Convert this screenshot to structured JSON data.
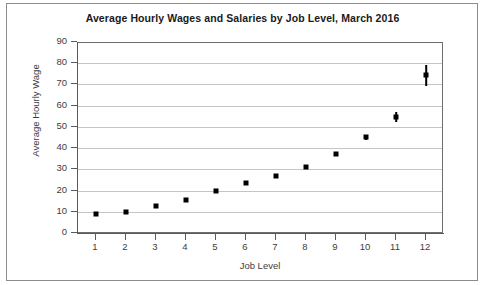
{
  "chart_data": {
    "type": "scatter",
    "title": "Average Hourly Wages and Salaries by Job Level, March 2016",
    "xlabel": "Job Level",
    "ylabel": "Average Hourly Wage",
    "xlim": [
      0.4,
      12.6
    ],
    "ylim": [
      0,
      90
    ],
    "grid": true,
    "legend": null,
    "x_ticks": [
      "1",
      "2",
      "3",
      "4",
      "5",
      "6",
      "7",
      "8",
      "9",
      "10",
      "11",
      "12"
    ],
    "y_ticks": [
      "0",
      "10",
      "20",
      "30",
      "40",
      "50",
      "60",
      "70",
      "80",
      "90"
    ],
    "x": [
      1,
      2,
      3,
      4,
      5,
      6,
      7,
      8,
      9,
      10,
      11,
      12
    ],
    "values": [
      9.2,
      10.2,
      13.0,
      16.1,
      20.2,
      24.2,
      27.5,
      31.4,
      37.5,
      45.6,
      55.0,
      74.8
    ],
    "error_low": [
      9.2,
      10.2,
      13.0,
      16.1,
      20.2,
      24.2,
      27.5,
      31.4,
      37.5,
      44.4,
      52.6,
      69.8
    ],
    "error_high": [
      9.2,
      10.2,
      13.0,
      16.1,
      20.2,
      24.2,
      27.5,
      31.4,
      37.5,
      46.8,
      57.4,
      79.8
    ],
    "marker": "square",
    "marker_color": "#000000",
    "gridline_color": "#c4c4c4",
    "axis_color": "#5a5a5a",
    "background_color": "#ffffff"
  }
}
